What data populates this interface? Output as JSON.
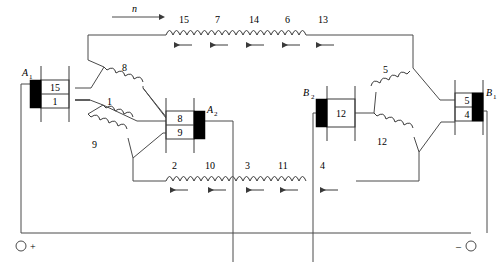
{
  "figure": {
    "rotation_label": "n",
    "terminals": {
      "positive": "+",
      "negative": "–"
    }
  },
  "brushes": [
    {
      "id": "A1",
      "letter": "A",
      "sub": "1",
      "side": "left",
      "segments": [
        "15",
        "1"
      ]
    },
    {
      "id": "A2",
      "letter": "A",
      "sub": "2",
      "side": "right",
      "segments": [
        "8",
        "9"
      ]
    },
    {
      "id": "B2",
      "letter": "B",
      "sub": "2",
      "side": "left",
      "segments": [
        "12"
      ]
    },
    {
      "id": "B1",
      "letter": "B",
      "sub": "1",
      "side": "right",
      "segments": [
        "5",
        "4"
      ]
    }
  ],
  "top_coils": {
    "labels": [
      "15",
      "7",
      "14",
      "6",
      "13"
    ],
    "current_direction": "left"
  },
  "bottom_coils": {
    "labels": [
      "2",
      "10",
      "3",
      "11",
      "4"
    ],
    "current_direction": "left"
  },
  "armature_coils_left": {
    "labels": [
      "8",
      "1",
      "9"
    ]
  },
  "armature_coils_right": {
    "labels": [
      "5",
      "12"
    ]
  },
  "colors": {
    "wire": "#4a4a4a",
    "ink": "#000000",
    "background": "#ffffff",
    "brush_fill": "#000000"
  }
}
